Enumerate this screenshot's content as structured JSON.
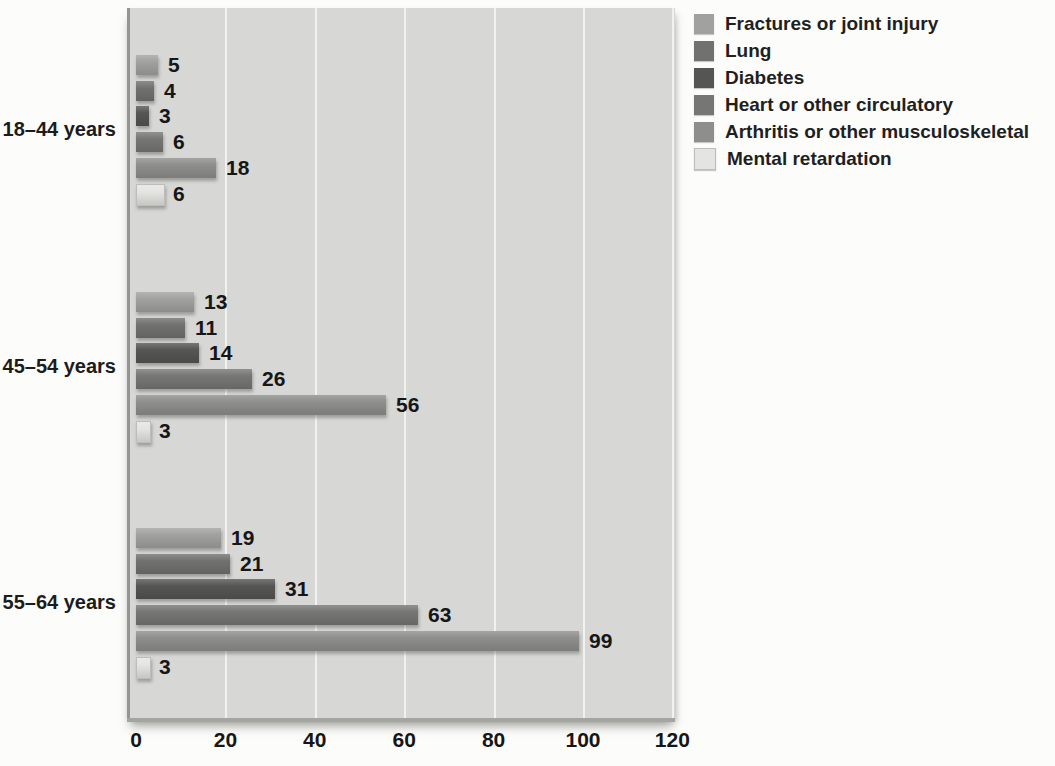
{
  "chart_data": {
    "type": "bar",
    "orientation": "horizontal",
    "title": "",
    "xlabel": "",
    "ylabel": "",
    "categories": [
      "18–44 years",
      "45–54 years",
      "55–64 years"
    ],
    "series": [
      {
        "name": "Fractures or joint injury",
        "color": "#a1a19f",
        "values": [
          5,
          13,
          19
        ]
      },
      {
        "name": "Lung",
        "color": "#717170",
        "values": [
          4,
          11,
          21
        ]
      },
      {
        "name": "Diabetes",
        "color": "#555553",
        "values": [
          3,
          14,
          31
        ]
      },
      {
        "name": "Heart or other circulatory",
        "color": "#767674",
        "values": [
          6,
          26,
          63
        ]
      },
      {
        "name": "Arthritis or other musculoskeletal",
        "color": "#8e8e8c",
        "values": [
          18,
          56,
          99
        ]
      },
      {
        "name": "Mental retardation",
        "color": "#e4e4e1",
        "border": "#bdbdb9",
        "values": [
          6,
          3,
          3
        ]
      }
    ],
    "x_ticks": [
      0,
      20,
      40,
      60,
      80,
      100,
      120
    ],
    "xlim": [
      0,
      120
    ],
    "data_labels": true,
    "grid": "vertical",
    "legend_position": "top-right",
    "colors": {
      "plot_background": "#d7d7d5",
      "gridline": "#f1f1ef",
      "axis_line": "#95958f",
      "page_background": "#fcfcfa",
      "text": "#1c1c1c"
    }
  }
}
